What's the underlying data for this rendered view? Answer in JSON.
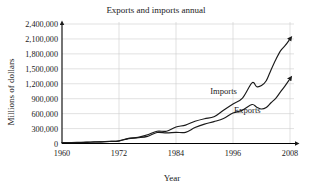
{
  "chart_data": {
    "type": "line",
    "title": "Exports and imports annual",
    "xlabel": "Year",
    "ylabel": "Millions of dollars",
    "xlim": [
      1960,
      2008
    ],
    "ylim": [
      0,
      2400000
    ],
    "grid": true,
    "legend": "inline-annotations",
    "xticks": [
      "1960",
      "1972",
      "1984",
      "1996",
      "2008"
    ],
    "xtick_values": [
      1960,
      1972,
      1984,
      1996,
      2008
    ],
    "yticks": [
      "0",
      "300,000",
      "600,000",
      "900,000",
      "1,200,000",
      "1,500,000",
      "1,800,000",
      "2,100,000",
      "2,400,000"
    ],
    "ytick_values": [
      0,
      300000,
      600000,
      900000,
      1200000,
      1500000,
      1800000,
      2100000,
      2400000
    ],
    "x": [
      1960,
      1962,
      1964,
      1966,
      1968,
      1970,
      1972,
      1974,
      1976,
      1978,
      1980,
      1982,
      1984,
      1986,
      1988,
      1990,
      1992,
      1994,
      1996,
      1998,
      2000,
      2001,
      2002,
      2003,
      2004,
      2005,
      2006,
      2007,
      2008
    ],
    "series": [
      {
        "name": "Imports",
        "label": "Imports",
        "values": [
          15000,
          17000,
          19000,
          26000,
          33000,
          40000,
          56000,
          103000,
          124000,
          176000,
          245000,
          247000,
          330000,
          370000,
          447000,
          498000,
          536000,
          669000,
          795000,
          913000,
          1218000,
          1141000,
          1163000,
          1260000,
          1477000,
          1682000,
          1861000,
          1969000,
          2100000
        ]
      },
      {
        "name": "Exports",
        "label": "Exports",
        "values": [
          20000,
          21000,
          26000,
          30000,
          34000,
          43000,
          49000,
          98000,
          115000,
          143000,
          221000,
          212000,
          224000,
          224000,
          320000,
          389000,
          440000,
          502000,
          612000,
          670000,
          782000,
          729000,
          693000,
          725000,
          819000,
          907000,
          1038000,
          1163000,
          1300000
        ]
      }
    ],
    "annotations": [
      {
        "text": "Imports",
        "x": 1994,
        "y": 1000000
      },
      {
        "text": "Exports",
        "x": 1999,
        "y": 620000
      }
    ]
  },
  "series_labels": {
    "imports": "Imports",
    "exports": "Exports"
  },
  "colors": {
    "line": "#1a1a1a",
    "grid": "#cfcfcf",
    "axis": "#000000",
    "background": "#ffffff"
  }
}
